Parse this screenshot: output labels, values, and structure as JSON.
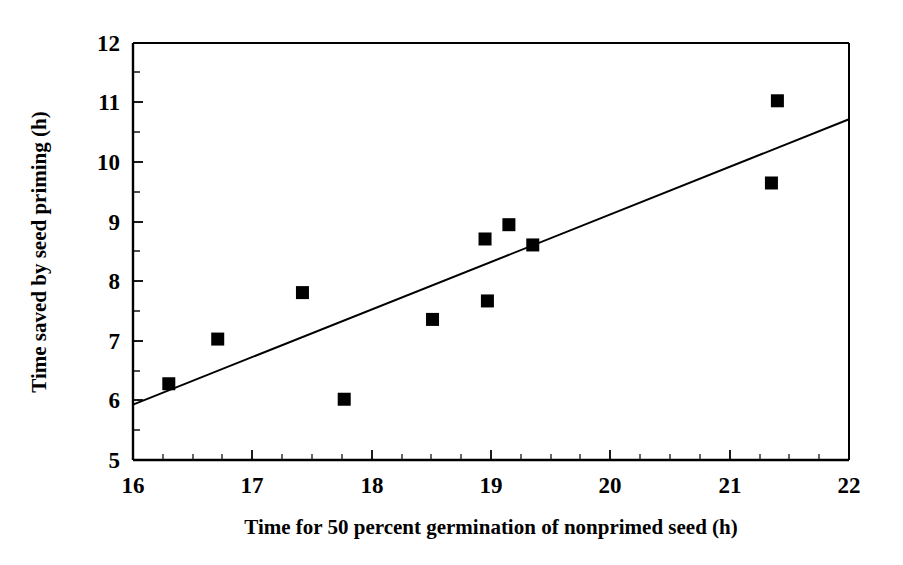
{
  "chart_data": {
    "type": "scatter",
    "title": "",
    "xlabel": "Time for 50 percent germination of nonprimed seed (h)",
    "ylabel": "Time saved by seed priming (h)",
    "xlim": [
      16,
      22
    ],
    "ylim": [
      5,
      12
    ],
    "xticks": [
      16,
      17,
      18,
      19,
      20,
      21,
      22
    ],
    "yticks": [
      5,
      6,
      7,
      8,
      9,
      10,
      11,
      12
    ],
    "xtick_labels": [
      "16",
      "17",
      "18",
      "19",
      "20",
      "21",
      "22"
    ],
    "ytick_labels": [
      "5",
      "6",
      "7",
      "8",
      "9",
      "10",
      "11",
      "12"
    ],
    "x_minor_tick_step": 0.25,
    "y_minor_tick_step": 0.5,
    "grid": false,
    "legend": null,
    "marker": "filled-square",
    "marker_color": "#000000",
    "marker_size_px": 13,
    "points": [
      {
        "x": 16.3,
        "y": 6.28
      },
      {
        "x": 16.71,
        "y": 7.03
      },
      {
        "x": 17.42,
        "y": 7.81
      },
      {
        "x": 17.77,
        "y": 6.02
      },
      {
        "x": 18.51,
        "y": 7.36
      },
      {
        "x": 18.95,
        "y": 8.71
      },
      {
        "x": 18.97,
        "y": 7.67
      },
      {
        "x": 19.15,
        "y": 8.95
      },
      {
        "x": 19.35,
        "y": 8.61
      },
      {
        "x": 21.35,
        "y": 9.65
      },
      {
        "x": 21.4,
        "y": 11.03
      }
    ],
    "trendline": {
      "type": "linear",
      "color": "#000000",
      "x_start": 16.0,
      "y_start": 5.93,
      "x_end": 22.0,
      "y_end": 10.72
    },
    "axis_color": "#000000",
    "background_color": "#ffffff"
  }
}
